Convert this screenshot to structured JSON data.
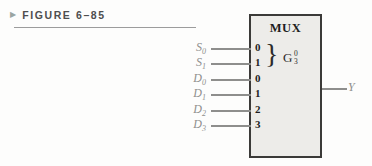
{
  "figure": {
    "arrow_icon": "▶",
    "label": "FIGURE 6–85"
  },
  "mux": {
    "title": "MUX",
    "select_brace": "}",
    "select_group": {
      "letter": "G",
      "sup": "0",
      "sub": "3"
    },
    "select_inputs": [
      {
        "name": "S",
        "sub": "0",
        "pin": "0"
      },
      {
        "name": "S",
        "sub": "1",
        "pin": "1"
      }
    ],
    "data_inputs": [
      {
        "name": "D",
        "sub": "0",
        "pin": "0"
      },
      {
        "name": "D",
        "sub": "1",
        "pin": "1"
      },
      {
        "name": "D",
        "sub": "2",
        "pin": "2"
      },
      {
        "name": "D",
        "sub": "3",
        "pin": "3"
      }
    ],
    "output": {
      "name": "Y"
    }
  },
  "colors": {
    "box_fill": "#edece9",
    "box_border": "#3b3a38",
    "wire": "#8e8e8c",
    "signal_label": "#8f8f8d",
    "pin_text": "#1e1e1e",
    "figure_label": "#4e4e4e"
  }
}
